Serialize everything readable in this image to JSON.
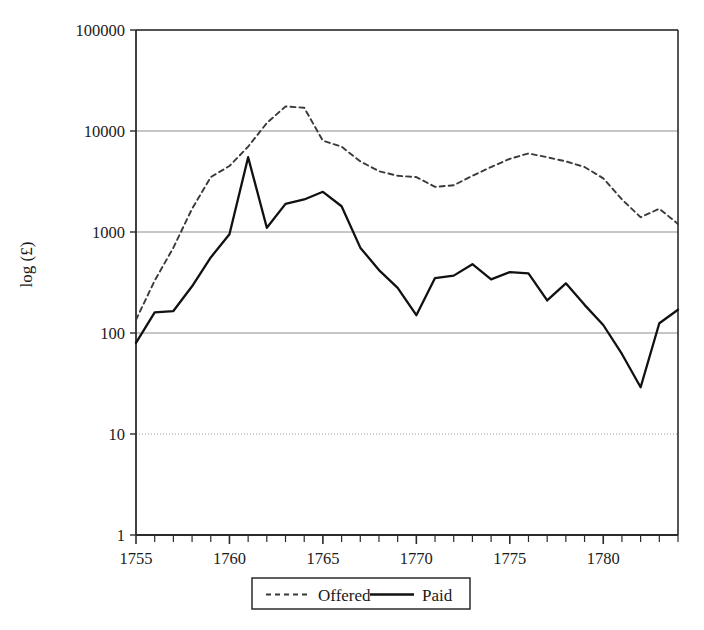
{
  "chart_data": {
    "type": "line",
    "title": "",
    "xlabel": "",
    "ylabel": "log (£)",
    "yscale": "log",
    "ylim": [
      1,
      100000
    ],
    "xlim": [
      1755,
      1784
    ],
    "grid": true,
    "legend_position": "below-axis",
    "ytick_labels": [
      "1",
      "10",
      "100",
      "1000",
      "10000",
      "100000"
    ],
    "ytick_values": [
      1,
      10,
      100,
      1000,
      10000,
      100000
    ],
    "xtick_labels": [
      "1755",
      "1760",
      "1765",
      "1770",
      "1775",
      "1780"
    ],
    "xtick_values": [
      1755,
      1760,
      1765,
      1770,
      1775,
      1780
    ],
    "x_minor_tick_step": 1,
    "x": [
      1755,
      1756,
      1757,
      1758,
      1759,
      1760,
      1761,
      1762,
      1763,
      1764,
      1765,
      1766,
      1767,
      1768,
      1769,
      1770,
      1771,
      1772,
      1773,
      1774,
      1775,
      1776,
      1777,
      1778,
      1779,
      1780,
      1781,
      1782,
      1783,
      1784
    ],
    "series": [
      {
        "name": "Offered",
        "style": "dashed",
        "color": "#3a3a3a",
        "values": [
          135,
          330,
          700,
          1700,
          3500,
          4500,
          7000,
          12000,
          17500,
          17000,
          8000,
          7000,
          5000,
          4000,
          3600,
          3500,
          2800,
          2900,
          3600,
          4400,
          5300,
          6000,
          5500,
          5000,
          4400,
          3400,
          2100,
          1400,
          1700,
          1200
        ]
      },
      {
        "name": "Paid",
        "style": "solid",
        "color": "#111111",
        "values": [
          80,
          160,
          165,
          290,
          560,
          950,
          5500,
          1100,
          1900,
          2100,
          2500,
          1800,
          700,
          420,
          280,
          150,
          350,
          370,
          480,
          340,
          400,
          390,
          210,
          310,
          190,
          120,
          62,
          29,
          125,
          170
        ]
      }
    ]
  },
  "legend": {
    "items": [
      {
        "label": "Offered",
        "style": "dashed"
      },
      {
        "label": "Paid",
        "style": "solid"
      }
    ]
  },
  "axes": {
    "y_title": "log (£)"
  }
}
